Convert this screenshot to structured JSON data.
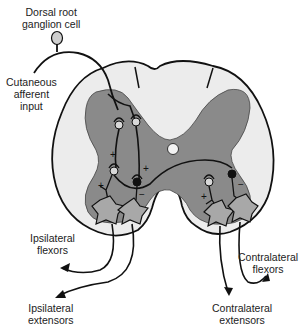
{
  "labels": {
    "drg": [
      "Dorsal root",
      "ganglion cell"
    ],
    "cutaneous": [
      "Cutaneous",
      "afferent",
      "input"
    ],
    "ipsi_flex": [
      "Ipsilateral",
      "flexors"
    ],
    "ipsi_ext": [
      "Ipsilateral",
      "extensors"
    ],
    "contra_flex": [
      "Contralateral",
      "flexors"
    ],
    "contra_ext": [
      "Contralateral",
      "extensors"
    ]
  },
  "signs": {
    "plus": "+",
    "minus": "−"
  },
  "colors": {
    "white_matter": "#ececec",
    "grey_matter": "#8a8a8a",
    "outline": "#111111",
    "neuron_excitatory": "#d8d8d8",
    "neuron_inhibitory": "#111111",
    "motor_neuron": "#a8a8a8"
  }
}
